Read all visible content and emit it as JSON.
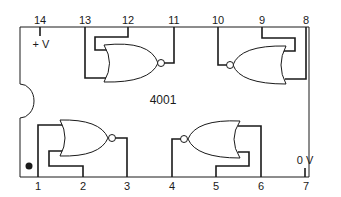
{
  "chip": {
    "part_number": "4001",
    "description": "Quad 2-input NOR gate pinout"
  },
  "pins": {
    "p1": "1",
    "p2": "2",
    "p3": "3",
    "p4": "4",
    "p5": "5",
    "p6": "6",
    "p7": "7",
    "p8": "8",
    "p9": "9",
    "p10": "10",
    "p11": "11",
    "p12": "12",
    "p13": "13",
    "p14": "14"
  },
  "power": {
    "vdd_label": "+ V",
    "vss_label": "0 V"
  },
  "gates": [
    {
      "name": "NOR A",
      "inputs": [
        "1",
        "2"
      ],
      "output": "3"
    },
    {
      "name": "NOR B",
      "inputs": [
        "5",
        "6"
      ],
      "output": "4"
    },
    {
      "name": "NOR C",
      "inputs": [
        "8",
        "9"
      ],
      "output": "10"
    },
    {
      "name": "NOR D",
      "inputs": [
        "12",
        "13"
      ],
      "output": "11"
    }
  ],
  "colors": {
    "line": "#1a1a1a",
    "background": "#ffffff"
  }
}
